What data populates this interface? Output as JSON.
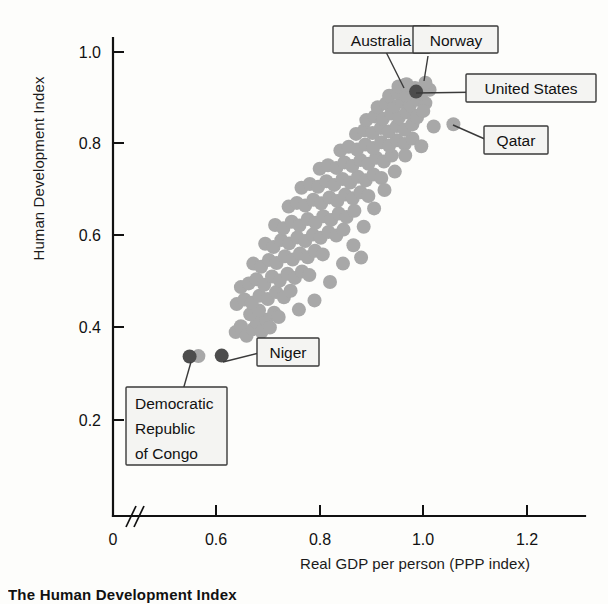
{
  "caption": "The Human Development Index",
  "axes": {
    "ylabel": "Human Development Index",
    "xlabel": "Real GDP per person (PPP index)",
    "y_ticks": [
      "1.0",
      "0.8",
      "0.6",
      "0.4",
      "0.2"
    ],
    "x_ticks": [
      "0",
      "0.6",
      "0.8",
      "1.0",
      "1.2"
    ],
    "axis_break": "//"
  },
  "callouts": [
    {
      "id": "australia",
      "label": "Australia"
    },
    {
      "id": "norway",
      "label": "Norway"
    },
    {
      "id": "united-states",
      "label": "United States"
    },
    {
      "id": "qatar",
      "label": "Qatar"
    },
    {
      "id": "niger",
      "label": "Niger"
    },
    {
      "id": "drc",
      "label": "Democratic\nRepublic\nof Congo"
    },
    {
      "id": "drc-l1",
      "label": "Democratic"
    },
    {
      "id": "drc-l2",
      "label": "Republic"
    },
    {
      "id": "drc-l3",
      "label": "of Congo"
    }
  ],
  "colors": {
    "point": "#a8a8a8",
    "highlight": "#4d4d4d",
    "axis": "#111111",
    "box_fill": "#f4f4f2",
    "box_stroke": "#3a3a3a",
    "background": "#fdfdfb"
  },
  "chart_data": {
    "type": "scatter",
    "title": "The Human Development Index",
    "xlabel": "Real GDP per person (PPP index)",
    "ylabel": "Human Development Index",
    "xlim": [
      0.5,
      1.3
    ],
    "ylim": [
      0.1,
      1.05
    ],
    "xticks": [
      0,
      0.6,
      0.8,
      1.0,
      1.2
    ],
    "yticks": [
      0.2,
      0.4,
      0.6,
      0.8,
      1.0
    ],
    "grid": false,
    "legend": "none",
    "axis_break_x": true,
    "marker_radius_px": 7,
    "highlighted": [
      {
        "name": "Australia",
        "x": 0.965,
        "y": 0.929,
        "color": "point"
      },
      {
        "name": "Norway",
        "x": 1.004,
        "y": 0.933,
        "color": "point"
      },
      {
        "name": "United States",
        "x": 0.986,
        "y": 0.914,
        "color": "highlight"
      },
      {
        "name": "Qatar",
        "x": 1.058,
        "y": 0.843,
        "color": "point"
      },
      {
        "name": "Niger",
        "x": 0.611,
        "y": 0.34,
        "color": "highlight"
      },
      {
        "name": "Democratic Republic of Congo",
        "x": 0.549,
        "y": 0.338,
        "color": "highlight"
      }
    ],
    "points": [
      [
        0.566,
        0.339
      ],
      [
        0.611,
        0.34
      ],
      [
        0.549,
        0.338
      ],
      [
        0.638,
        0.391
      ],
      [
        0.648,
        0.404
      ],
      [
        0.659,
        0.383
      ],
      [
        0.672,
        0.398
      ],
      [
        0.679,
        0.411
      ],
      [
        0.688,
        0.392
      ],
      [
        0.697,
        0.418
      ],
      [
        0.704,
        0.401
      ],
      [
        0.666,
        0.43
      ],
      [
        0.683,
        0.438
      ],
      [
        0.712,
        0.433
      ],
      [
        0.721,
        0.424
      ],
      [
        0.64,
        0.452
      ],
      [
        0.655,
        0.462
      ],
      [
        0.669,
        0.455
      ],
      [
        0.684,
        0.47
      ],
      [
        0.7,
        0.463
      ],
      [
        0.716,
        0.478
      ],
      [
        0.731,
        0.467
      ],
      [
        0.744,
        0.481
      ],
      [
        0.648,
        0.489
      ],
      [
        0.663,
        0.497
      ],
      [
        0.678,
        0.506
      ],
      [
        0.693,
        0.494
      ],
      [
        0.708,
        0.512
      ],
      [
        0.723,
        0.503
      ],
      [
        0.738,
        0.518
      ],
      [
        0.752,
        0.509
      ],
      [
        0.766,
        0.523
      ],
      [
        0.78,
        0.515
      ],
      [
        0.672,
        0.54
      ],
      [
        0.687,
        0.533
      ],
      [
        0.702,
        0.548
      ],
      [
        0.717,
        0.541
      ],
      [
        0.733,
        0.556
      ],
      [
        0.748,
        0.549
      ],
      [
        0.762,
        0.562
      ],
      [
        0.777,
        0.554
      ],
      [
        0.791,
        0.568
      ],
      [
        0.806,
        0.56
      ],
      [
        0.695,
        0.583
      ],
      [
        0.711,
        0.576
      ],
      [
        0.726,
        0.591
      ],
      [
        0.741,
        0.584
      ],
      [
        0.757,
        0.597
      ],
      [
        0.772,
        0.589
      ],
      [
        0.787,
        0.603
      ],
      [
        0.802,
        0.596
      ],
      [
        0.817,
        0.609
      ],
      [
        0.832,
        0.601
      ],
      [
        0.846,
        0.614
      ],
      [
        0.714,
        0.624
      ],
      [
        0.73,
        0.617
      ],
      [
        0.746,
        0.631
      ],
      [
        0.761,
        0.623
      ],
      [
        0.777,
        0.637
      ],
      [
        0.792,
        0.629
      ],
      [
        0.807,
        0.643
      ],
      [
        0.822,
        0.635
      ],
      [
        0.837,
        0.649
      ],
      [
        0.852,
        0.641
      ],
      [
        0.867,
        0.655
      ],
      [
        0.74,
        0.664
      ],
      [
        0.756,
        0.672
      ],
      [
        0.772,
        0.666
      ],
      [
        0.788,
        0.679
      ],
      [
        0.803,
        0.671
      ],
      [
        0.819,
        0.684
      ],
      [
        0.834,
        0.676
      ],
      [
        0.849,
        0.69
      ],
      [
        0.864,
        0.682
      ],
      [
        0.879,
        0.695
      ],
      [
        0.894,
        0.687
      ],
      [
        0.765,
        0.705
      ],
      [
        0.781,
        0.713
      ],
      [
        0.797,
        0.707
      ],
      [
        0.813,
        0.719
      ],
      [
        0.828,
        0.711
      ],
      [
        0.844,
        0.724
      ],
      [
        0.859,
        0.716
      ],
      [
        0.874,
        0.729
      ],
      [
        0.889,
        0.721
      ],
      [
        0.904,
        0.734
      ],
      [
        0.919,
        0.726
      ],
      [
        0.8,
        0.746
      ],
      [
        0.816,
        0.754
      ],
      [
        0.832,
        0.748
      ],
      [
        0.848,
        0.76
      ],
      [
        0.863,
        0.752
      ],
      [
        0.879,
        0.765
      ],
      [
        0.894,
        0.757
      ],
      [
        0.909,
        0.77
      ],
      [
        0.924,
        0.762
      ],
      [
        0.939,
        0.775
      ],
      [
        0.84,
        0.786
      ],
      [
        0.856,
        0.794
      ],
      [
        0.872,
        0.788
      ],
      [
        0.888,
        0.799
      ],
      [
        0.903,
        0.791
      ],
      [
        0.919,
        0.804
      ],
      [
        0.934,
        0.796
      ],
      [
        0.949,
        0.808
      ],
      [
        0.964,
        0.8
      ],
      [
        0.979,
        0.812
      ],
      [
        0.87,
        0.822
      ],
      [
        0.886,
        0.83
      ],
      [
        0.902,
        0.824
      ],
      [
        0.918,
        0.835
      ],
      [
        0.933,
        0.827
      ],
      [
        0.949,
        0.839
      ],
      [
        0.964,
        0.831
      ],
      [
        0.979,
        0.843
      ],
      [
        0.89,
        0.852
      ],
      [
        0.906,
        0.86
      ],
      [
        0.922,
        0.855
      ],
      [
        0.938,
        0.866
      ],
      [
        0.953,
        0.858
      ],
      [
        0.968,
        0.869
      ],
      [
        0.983,
        0.862
      ],
      [
        0.912,
        0.88
      ],
      [
        0.928,
        0.888
      ],
      [
        0.944,
        0.882
      ],
      [
        0.959,
        0.893
      ],
      [
        0.974,
        0.885
      ],
      [
        0.989,
        0.896
      ],
      [
        1.004,
        0.889
      ],
      [
        0.934,
        0.905
      ],
      [
        0.95,
        0.912
      ],
      [
        0.966,
        0.906
      ],
      [
        0.981,
        0.916
      ],
      [
        0.996,
        0.909
      ],
      [
        1.012,
        0.918
      ],
      [
        0.952,
        0.925
      ],
      [
        0.968,
        0.93
      ],
      [
        0.984,
        0.922
      ],
      [
        0.88,
        0.553
      ],
      [
        0.996,
        0.795
      ],
      [
        1.02,
        0.838
      ],
      [
        1.058,
        0.843
      ],
      [
        0.76,
        0.44
      ],
      [
        0.79,
        0.46
      ],
      [
        0.82,
        0.5
      ],
      [
        0.845,
        0.54
      ],
      [
        0.865,
        0.58
      ],
      [
        0.885,
        0.62
      ],
      [
        0.905,
        0.66
      ],
      [
        0.925,
        0.7
      ],
      [
        0.945,
        0.74
      ],
      [
        0.965,
        0.775
      ],
      [
        0.988,
        0.858
      ],
      [
        1.0,
        0.872
      ]
    ]
  }
}
